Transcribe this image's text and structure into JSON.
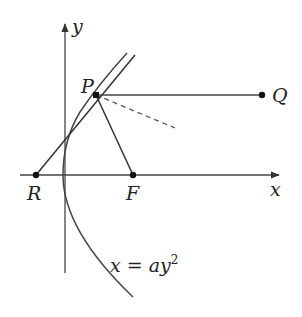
{
  "diagram": {
    "type": "parabola-reflection",
    "colors": {
      "stroke": "#333333",
      "text": "#222222",
      "background": "#ffffff"
    },
    "axes": {
      "x_label": "x",
      "y_label": "y"
    },
    "points": {
      "P": {
        "label": "P"
      },
      "Q": {
        "label": "Q"
      },
      "R": {
        "label": "R"
      },
      "F": {
        "label": "F"
      }
    },
    "curve": {
      "equation_prefix": "x = ay",
      "equation_exponent": "2"
    },
    "segments": [
      {
        "name": "PQ",
        "style": "solid"
      },
      {
        "name": "PF",
        "style": "solid"
      },
      {
        "name": "tangent-RP",
        "style": "solid"
      },
      {
        "name": "reflected-ray",
        "style": "dashed"
      }
    ]
  }
}
